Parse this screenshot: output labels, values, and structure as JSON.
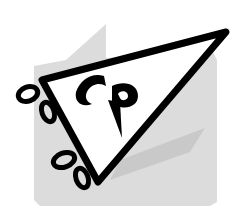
{
  "logo": {
    "monogram": "CP",
    "description": "Pennant flag with CP monogram",
    "colors": {
      "background": "#ffffff",
      "panel": "#d9d9d9",
      "shadow": "#bdbdbd",
      "pennant_fill": "#ffffff",
      "stroke": "#000000"
    }
  }
}
